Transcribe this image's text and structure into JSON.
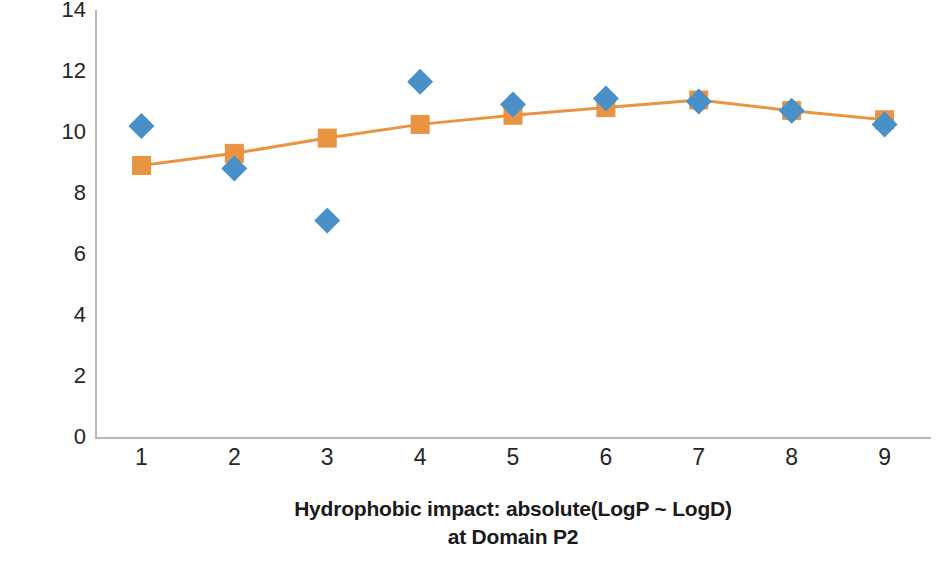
{
  "chart_data": {
    "type": "scatter",
    "title": "",
    "subtitle": "",
    "xlabel": "Hydrophobic impact: absolute(LogP ~ LogD)",
    "xlabel_line2": "at Domain P2",
    "ylabel": "Interaction efficacy at tenor point",
    "x": [
      1,
      2,
      3,
      4,
      5,
      6,
      7,
      8,
      9
    ],
    "xticklabels": [
      "1",
      "2",
      "3",
      "4",
      "5",
      "6",
      "7",
      "8",
      "9"
    ],
    "yticklabels": [
      "0",
      "2",
      "4",
      "6",
      "8",
      "10",
      "12",
      "14"
    ],
    "yticks": [
      0,
      2,
      4,
      6,
      8,
      10,
      12,
      14
    ],
    "xlim": [
      0.5,
      9.5
    ],
    "ylim": [
      0,
      14
    ],
    "grid": false,
    "legend": false,
    "legend_position": "none",
    "series": [
      {
        "name": "Observed",
        "marker": "diamond",
        "color": "#4A90C8",
        "line": false,
        "values": [
          10.2,
          8.8,
          7.1,
          11.65,
          10.9,
          11.1,
          11.0,
          10.7,
          10.25
        ]
      },
      {
        "name": "Fitted",
        "marker": "square",
        "color": "#E89442",
        "line": true,
        "values": [
          8.9,
          9.3,
          9.8,
          10.25,
          10.55,
          10.8,
          11.05,
          10.7,
          10.4
        ]
      }
    ],
    "colors": {
      "series1": "#4A90C8",
      "series2": "#E89442",
      "axis": "#b8b8b8",
      "text": "#262626",
      "background": "#ffffff"
    }
  }
}
